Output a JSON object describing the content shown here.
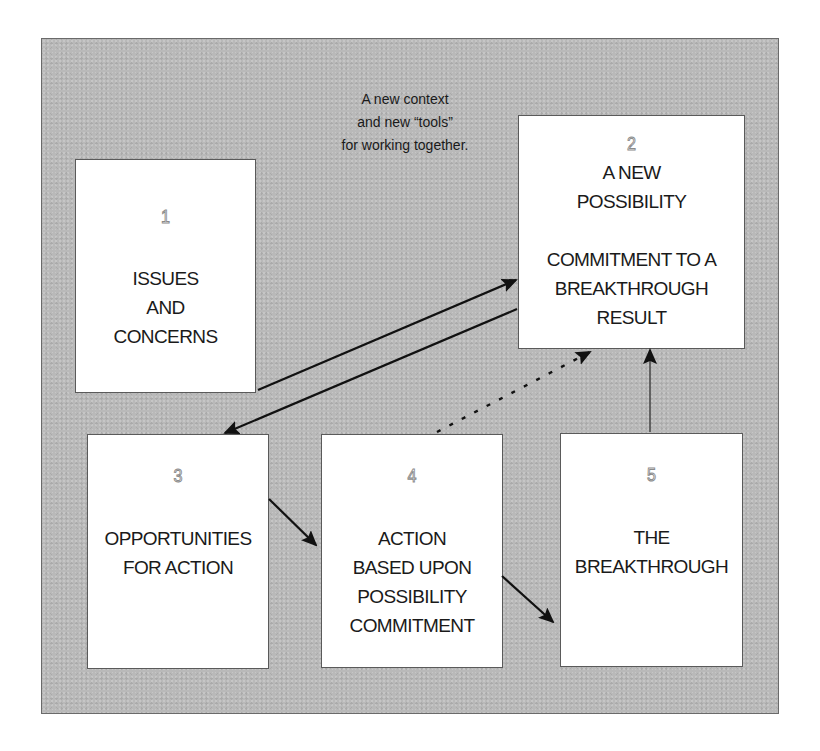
{
  "diagram": {
    "annotation": "A new context\nand new “tools”\nfor working together.",
    "boxes": [
      {
        "id": "1",
        "number": "1",
        "label": "ISSUES\nAND\nCONCERNS"
      },
      {
        "id": "2",
        "number": "2",
        "label": "A NEW\nPOSSIBILITY\n\nCOMMITMENT TO A\nBREAKTHROUGH\nRESULT"
      },
      {
        "id": "3",
        "number": "3",
        "label": "OPPORTUNITIES\nFOR ACTION"
      },
      {
        "id": "4",
        "number": "4",
        "label": "ACTION\nBASED UPON\nPOSSIBILITY\nCOMMITMENT"
      },
      {
        "id": "5",
        "number": "5",
        "label": "THE\nBREAKTHROUGH"
      }
    ],
    "connections": [
      {
        "from": "1",
        "to": "2",
        "style": "solid"
      },
      {
        "from": "2",
        "to": "3",
        "style": "solid"
      },
      {
        "from": "3",
        "to": "4",
        "style": "solid"
      },
      {
        "from": "4",
        "to": "5",
        "style": "solid"
      },
      {
        "from": "4",
        "to": "2",
        "style": "dashed"
      },
      {
        "from": "5",
        "to": "2",
        "style": "solid"
      }
    ],
    "colors": {
      "panel": "#b9b9b9",
      "box": "#ffffff",
      "text": "#1a1a1a",
      "arrow": "#111111",
      "number_outline": "#8a8a8a"
    }
  }
}
